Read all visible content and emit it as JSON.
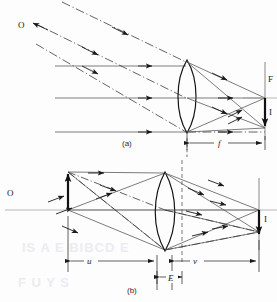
{
  "figure": {
    "panels": [
      {
        "id": "a",
        "caption": "(a)",
        "description": "Distant object: parallel ray bundles focused at the focal plane",
        "labels": {
          "object": "O",
          "focal_point": "F",
          "image": "I",
          "focal_length": "f"
        }
      },
      {
        "id": "b",
        "caption": "(b)",
        "description": "Near object: object and image conjugate distances",
        "labels": {
          "object": "O",
          "image": "I",
          "object_distance": "u",
          "image_distance": "v",
          "lens_thickness": "E"
        }
      }
    ],
    "colors": {
      "ink": "#1a1a1a",
      "ray_solid": "#4a4a4a",
      "ray_chain": "#3a3a3a",
      "axis": "#8a8a8a",
      "paper": "#fdfdfd"
    },
    "showthrough_text": "IS A E BIBCD E"
  }
}
